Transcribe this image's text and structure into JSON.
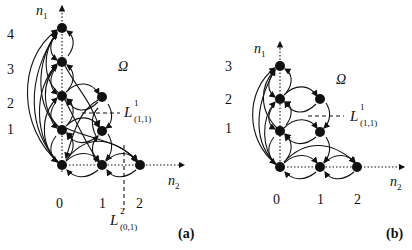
{
  "panels": [
    {
      "id": "a",
      "label": "(a)",
      "y_axis": {
        "name": "n",
        "sub": "1",
        "ticks": [
          "4",
          "3",
          "2",
          "1"
        ]
      },
      "x_axis": {
        "name": "n",
        "sub": "2",
        "ticks": [
          "0",
          "1",
          "2"
        ]
      },
      "region": "Ω",
      "lines": [
        {
          "name": "L",
          "sup": "1",
          "sub": "(1,1)"
        },
        {
          "name": "L",
          "sup": "2",
          "sub": "(0,1)"
        }
      ],
      "nodes": [
        [
          0,
          0
        ],
        [
          0,
          1
        ],
        [
          0,
          2
        ],
        [
          0,
          3
        ],
        [
          0,
          4
        ],
        [
          1,
          0
        ],
        [
          1,
          1
        ],
        [
          1,
          2
        ],
        [
          2,
          0
        ]
      ]
    },
    {
      "id": "b",
      "label": "(b)",
      "y_axis": {
        "name": "n",
        "sub": "1",
        "ticks": [
          "3",
          "2",
          "1"
        ]
      },
      "x_axis": {
        "name": "n",
        "sub": "2",
        "ticks": [
          "0",
          "1",
          "2"
        ]
      },
      "region": "Ω",
      "lines": [
        {
          "name": "L",
          "sup": "1",
          "sub": "(1,1)"
        }
      ],
      "nodes": [
        [
          0,
          0
        ],
        [
          0,
          1
        ],
        [
          0,
          2
        ],
        [
          0,
          3
        ],
        [
          1,
          0
        ],
        [
          1,
          1
        ],
        [
          1,
          2
        ],
        [
          2,
          0
        ]
      ]
    }
  ]
}
